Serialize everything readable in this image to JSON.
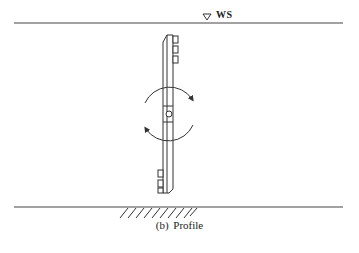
{
  "figure": {
    "caption": "(b)  Profile",
    "water_surface_label": "WS",
    "water_surface_symbol": "inverted-triangle",
    "elements": [
      "water-surface-line",
      "bed-line",
      "bed-hatching",
      "vertical-plate",
      "upper-tabs",
      "lower-tabs",
      "pivot-pin",
      "rotation-arrow-upper",
      "rotation-arrow-lower"
    ],
    "line_color": "#333333"
  }
}
